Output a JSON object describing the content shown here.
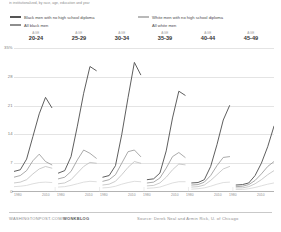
{
  "deck": "in institutionalized, by race, age, education and year",
  "legend": {
    "left": [
      {
        "label": "Black men with no high school diploma",
        "color": "#555555",
        "swatch": true
      },
      {
        "label": "All black men",
        "color": "#8e8e8e",
        "swatch": true
      }
    ],
    "right": [
      {
        "label": "White men with no high school diploma",
        "color": "#b9b9b9",
        "swatch": true
      },
      {
        "label": "All white men",
        "color": "#d3d3d3",
        "swatch": false
      }
    ]
  },
  "axis": {
    "y_ticks": [
      "35%",
      "28",
      "21",
      "14",
      "7",
      "0"
    ],
    "x_ticks": [
      "1980",
      "2010"
    ]
  },
  "panels": [
    {
      "kicker": "AGE",
      "range": "20-24"
    },
    {
      "kicker": "AGE",
      "range": "25-29"
    },
    {
      "kicker": "AGE",
      "range": "30-34"
    },
    {
      "kicker": "AGE",
      "range": "35-39"
    },
    {
      "kicker": "AGE",
      "range": "40-44"
    },
    {
      "kicker": "AGE",
      "range": "45-49"
    }
  ],
  "footer": {
    "brand_plain": "WASHINGTONPOST.COM/",
    "brand_bold": "WONKBLOG",
    "source": "Source: Derek Neal and Armin Rick, U. of Chicago"
  },
  "chart_data": {
    "type": "line",
    "title": "in institutionalized, by race, age, education and year",
    "xlabel": "",
    "ylabel": "Percent institutionalized",
    "ylim": [
      0,
      35
    ],
    "xlim": [
      1980,
      2010
    ],
    "grid": true,
    "legend_position": "top",
    "y_ticks": [
      0,
      7,
      14,
      21,
      28,
      35
    ],
    "x_ticks": [
      1980,
      2010
    ],
    "x": [
      1980,
      1985,
      1990,
      1995,
      2000,
      2005,
      2010
    ],
    "panel_variable": "age group",
    "panels": [
      {
        "name": "AGE 20-24",
        "series": [
          {
            "name": "Black men with no high school diploma",
            "color": "#555555",
            "values": [
              5.0,
              5.4,
              8.0,
              13.5,
              19.0,
              23.0,
              20.5
            ]
          },
          {
            "name": "All black men",
            "color": "#8e8e8e",
            "values": [
              3.6,
              4.0,
              5.2,
              7.6,
              9.2,
              7.4,
              6.6
            ]
          },
          {
            "name": "White men with no high school diploma",
            "color": "#b9b9b9",
            "values": [
              2.2,
              2.4,
              3.0,
              4.4,
              5.6,
              6.2,
              5.8
            ]
          },
          {
            "name": "All white men",
            "color": "#d3d3d3",
            "values": [
              1.3,
              1.4,
              1.6,
              2.0,
              2.3,
              2.4,
              2.3
            ]
          }
        ]
      },
      {
        "name": "AGE 25-29",
        "series": [
          {
            "name": "Black men with no high school diploma",
            "color": "#555555",
            "values": [
              4.6,
              5.2,
              8.6,
              16.0,
              24.0,
              30.5,
              29.5
            ]
          },
          {
            "name": "All black men",
            "color": "#8e8e8e",
            "values": [
              3.2,
              3.6,
              5.0,
              7.8,
              10.2,
              9.4,
              8.2
            ]
          },
          {
            "name": "White men with no high school diploma",
            "color": "#b9b9b9",
            "values": [
              2.0,
              2.2,
              3.0,
              4.6,
              6.2,
              7.2,
              7.0
            ]
          },
          {
            "name": "All white men",
            "color": "#d3d3d3",
            "values": [
              1.2,
              1.3,
              1.6,
              2.0,
              2.4,
              2.6,
              2.5
            ]
          }
        ]
      },
      {
        "name": "AGE 30-34",
        "series": [
          {
            "name": "Black men with no high school diploma",
            "color": "#555555",
            "values": [
              3.6,
              4.0,
              6.4,
              14.0,
              23.0,
              31.5,
              28.5
            ]
          },
          {
            "name": "All black men",
            "color": "#8e8e8e",
            "values": [
              2.6,
              3.0,
              4.2,
              7.0,
              9.8,
              10.2,
              8.6
            ]
          },
          {
            "name": "White men with no high school diploma",
            "color": "#b9b9b9",
            "values": [
              1.7,
              1.9,
              2.6,
              4.2,
              6.0,
              7.4,
              7.0
            ]
          },
          {
            "name": "All white men",
            "color": "#d3d3d3",
            "values": [
              1.0,
              1.1,
              1.4,
              1.9,
              2.3,
              2.6,
              2.5
            ]
          }
        ]
      },
      {
        "name": "AGE 35-39",
        "series": [
          {
            "name": "Black men with no high school diploma",
            "color": "#555555",
            "values": [
              3.0,
              3.2,
              4.6,
              10.0,
              18.0,
              24.5,
              23.5
            ]
          },
          {
            "name": "All black men",
            "color": "#8e8e8e",
            "values": [
              2.2,
              2.4,
              3.4,
              5.8,
              8.6,
              9.6,
              8.4
            ]
          },
          {
            "name": "White men with no high school diploma",
            "color": "#b9b9b9",
            "values": [
              1.5,
              1.6,
              2.2,
              3.6,
              5.4,
              6.8,
              6.6
            ]
          },
          {
            "name": "All white men",
            "color": "#d3d3d3",
            "values": [
              0.9,
              1.0,
              1.2,
              1.7,
              2.2,
              2.5,
              2.5
            ]
          }
        ]
      },
      {
        "name": "AGE 40-44",
        "series": [
          {
            "name": "Black men with no high school diploma",
            "color": "#555555",
            "values": [
              2.2,
              2.3,
              3.0,
              6.2,
              11.5,
              17.5,
              21.0
            ]
          },
          {
            "name": "All black men",
            "color": "#8e8e8e",
            "values": [
              1.7,
              1.8,
              2.4,
              4.0,
              6.4,
              8.4,
              8.6
            ]
          },
          {
            "name": "White men with no high school diploma",
            "color": "#b9b9b9",
            "values": [
              1.2,
              1.3,
              1.7,
              2.8,
              4.2,
              5.6,
              6.2
            ]
          },
          {
            "name": "All white men",
            "color": "#d3d3d3",
            "values": [
              0.7,
              0.8,
              1.0,
              1.4,
              1.9,
              2.3,
              2.4
            ]
          }
        ]
      },
      {
        "name": "AGE 45-49",
        "series": [
          {
            "name": "Black men with no high school diploma",
            "color": "#555555",
            "values": [
              1.7,
              1.8,
              2.2,
              4.0,
              7.0,
              11.0,
              16.0
            ]
          },
          {
            "name": "All black men",
            "color": "#8e8e8e",
            "values": [
              1.3,
              1.4,
              1.8,
              2.8,
              4.4,
              6.2,
              7.4
            ]
          },
          {
            "name": "White men with no high school diploma",
            "color": "#b9b9b9",
            "values": [
              1.0,
              1.0,
              1.3,
              2.0,
              3.0,
              4.2,
              5.2
            ]
          },
          {
            "name": "All white men",
            "color": "#d3d3d3",
            "values": [
              0.6,
              0.6,
              0.8,
              1.1,
              1.5,
              1.9,
              2.2
            ]
          }
        ]
      }
    ]
  }
}
